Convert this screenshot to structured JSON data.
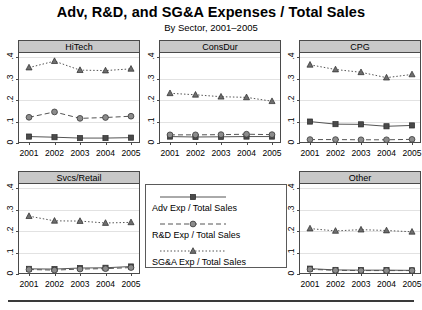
{
  "header": {
    "title": "Adv, R&D, and SG&A Expenses / Total Sales",
    "subtitle": "By Sector, 2001–2005"
  },
  "axis": {
    "y_ticks": [
      "0",
      ".1",
      ".2",
      ".3",
      ".4"
    ],
    "x_ticks": [
      "2001",
      "2002",
      "2003",
      "2004",
      "2005"
    ]
  },
  "legend": {
    "items": [
      {
        "label": "Adv Exp / Total Sales",
        "marker": "square",
        "line": "solid"
      },
      {
        "label": "R&D Exp / Total Sales",
        "marker": "circle",
        "line": "dashed"
      },
      {
        "label": "SG&A Exp / Total Sales",
        "marker": "triangle",
        "line": "dotted"
      }
    ]
  },
  "chart_data": {
    "type": "line",
    "title": "Adv, R&D, and SG&A Expenses / Total Sales",
    "subtitle": "By Sector, 2001–2005",
    "xlabel": "",
    "ylabel": "",
    "x": [
      2001,
      2002,
      2003,
      2004,
      2005
    ],
    "ylim": [
      0,
      0.42
    ],
    "yticks": [
      0,
      0.1,
      0.2,
      0.3,
      0.4
    ],
    "ytick_labels": [
      "0",
      ".1",
      ".2",
      ".3",
      ".4"
    ],
    "grid": true,
    "legend_position": "center-bottom-panel",
    "panels": [
      {
        "name": "HiTech",
        "series": [
          {
            "name": "Adv Exp / Total Sales",
            "marker": "square",
            "line": "solid",
            "values": [
              0.03,
              0.027,
              0.023,
              0.023,
              0.025
            ]
          },
          {
            "name": "R&D Exp / Total Sales",
            "marker": "circle",
            "line": "dashed",
            "values": [
              0.12,
              0.145,
              0.115,
              0.119,
              0.125
            ]
          },
          {
            "name": "SG&A Exp / Total Sales",
            "marker": "triangle",
            "line": "dotted",
            "values": [
              0.352,
              0.382,
              0.34,
              0.338,
              0.346
            ]
          }
        ]
      },
      {
        "name": "ConsDur",
        "series": [
          {
            "name": "Adv Exp / Total Sales",
            "marker": "square",
            "line": "solid",
            "values": [
              0.03,
              0.028,
              0.029,
              0.03,
              0.03
            ]
          },
          {
            "name": "R&D Exp / Total Sales",
            "marker": "circle",
            "line": "dashed",
            "values": [
              0.038,
              0.038,
              0.039,
              0.041,
              0.039
            ]
          },
          {
            "name": "SG&A Exp / Total Sales",
            "marker": "triangle",
            "line": "dotted",
            "values": [
              0.232,
              0.225,
              0.216,
              0.213,
              0.195
            ]
          }
        ]
      },
      {
        "name": "CPG",
        "series": [
          {
            "name": "Adv Exp / Total Sales",
            "marker": "square",
            "line": "solid",
            "values": [
              0.1,
              0.088,
              0.087,
              0.078,
              0.082
            ]
          },
          {
            "name": "R&D Exp / Total Sales",
            "marker": "circle",
            "line": "dashed",
            "values": [
              0.016,
              0.016,
              0.015,
              0.015,
              0.017
            ]
          },
          {
            "name": "SG&A Exp / Total Sales",
            "marker": "triangle",
            "line": "dotted",
            "values": [
              0.365,
              0.343,
              0.33,
              0.305,
              0.32
            ]
          }
        ]
      },
      {
        "name": "Svcs/Retail",
        "series": [
          {
            "name": "Adv Exp / Total Sales",
            "marker": "square",
            "line": "solid",
            "values": [
              0.024,
              0.023,
              0.028,
              0.029,
              0.035
            ]
          },
          {
            "name": "R&D Exp / Total Sales",
            "marker": "circle",
            "line": "dashed",
            "values": [
              0.021,
              0.018,
              0.023,
              0.025,
              0.03
            ]
          },
          {
            "name": "SG&A Exp / Total Sales",
            "marker": "triangle",
            "line": "dotted",
            "values": [
              0.27,
              0.248,
              0.247,
              0.238,
              0.241
            ]
          }
        ]
      },
      {
        "name": "Other",
        "series": [
          {
            "name": "Adv Exp / Total Sales",
            "marker": "square",
            "line": "solid",
            "values": [
              0.025,
              0.019,
              0.018,
              0.018,
              0.017
            ]
          },
          {
            "name": "R&D Exp / Total Sales",
            "marker": "circle",
            "line": "dashed",
            "values": [
              0.022,
              0.017,
              0.016,
              0.016,
              0.016
            ]
          },
          {
            "name": "SG&A Exp / Total Sales",
            "marker": "triangle",
            "line": "dotted",
            "values": [
              0.212,
              0.201,
              0.207,
              0.203,
              0.197
            ]
          }
        ]
      }
    ]
  }
}
